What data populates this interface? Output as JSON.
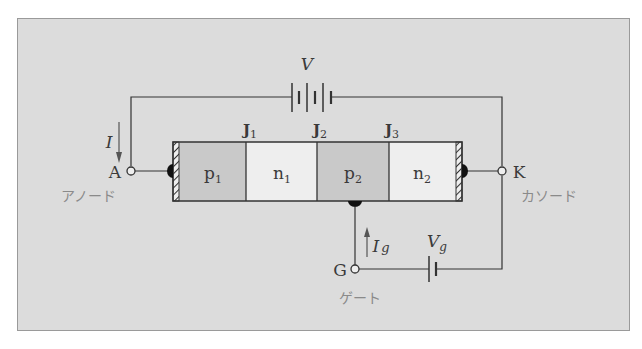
{
  "diagram": {
    "colors": {
      "background": "#dcdcdc",
      "p_region": "#c9c9c9",
      "n_region": "#eeeeee",
      "wire": "#333333",
      "label": "#3a3a3a",
      "jp_label": "#8a8a8a"
    },
    "layers": [
      {
        "label": "p",
        "sub": "1",
        "type": "p"
      },
      {
        "label": "n",
        "sub": "1",
        "type": "n"
      },
      {
        "label": "p",
        "sub": "2",
        "type": "p"
      },
      {
        "label": "n",
        "sub": "2",
        "type": "n"
      }
    ],
    "junctions": [
      {
        "label": "J",
        "sub": "1"
      },
      {
        "label": "J",
        "sub": "2"
      },
      {
        "label": "J",
        "sub": "3"
      }
    ],
    "terminals": {
      "anode": {
        "symbol": "A",
        "name": "アノード"
      },
      "cathode": {
        "symbol": "K",
        "name": "カソード"
      },
      "gate": {
        "symbol": "G",
        "name": "ゲート"
      }
    },
    "sources": {
      "main": {
        "label": "V"
      },
      "gate": {
        "label": "V",
        "sub": "g"
      }
    },
    "currents": {
      "main": {
        "label": "I",
        "direction": "down"
      },
      "gate": {
        "label": "I",
        "sub": "g",
        "direction": "up"
      }
    }
  }
}
